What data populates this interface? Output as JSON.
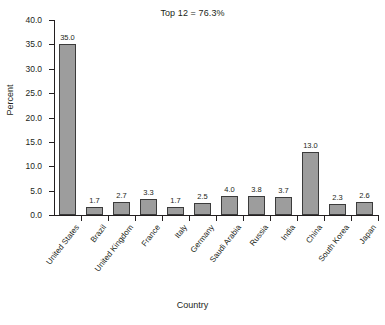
{
  "chart_data": {
    "type": "bar",
    "title": "Top 12 = 76.3%",
    "xlabel": "Country",
    "ylabel": "Percent",
    "ylim": [
      0,
      40
    ],
    "ytick_labels": [
      "40.0",
      "35.0",
      "30.0",
      "25.0",
      "20.0",
      "15.0",
      "10.0",
      "5.0",
      "0.0"
    ],
    "ytick_values": [
      40,
      35,
      30,
      25,
      20,
      15,
      10,
      5,
      0
    ],
    "grid": false,
    "legend": false,
    "categories": [
      "United States",
      "Brazil",
      "United Kingdom",
      "France",
      "Italy",
      "Germany",
      "Saudi Arabia",
      "Russia",
      "India",
      "China",
      "South Korea",
      "Japan"
    ],
    "values": [
      35.0,
      1.7,
      2.7,
      3.3,
      1.7,
      2.5,
      4.0,
      3.8,
      3.7,
      13.0,
      2.3,
      2.6
    ],
    "value_labels": [
      "35.0",
      "1.7",
      "2.7",
      "3.3",
      "1.7",
      "2.5",
      "4.0",
      "3.8",
      "3.7",
      "13.0",
      "2.3",
      "2.6"
    ],
    "bar_color": "#9d9d9d",
    "bar_border_color": "#3b3b3b",
    "axis_color": "#231f20",
    "background_color": "#ffffff"
  }
}
